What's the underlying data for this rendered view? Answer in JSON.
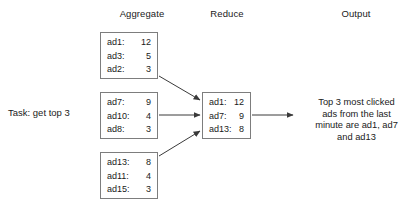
{
  "headers": {
    "aggregate": "Aggregate",
    "reduce": "Reduce",
    "output": "Output"
  },
  "task": {
    "label": "Task: get top 3"
  },
  "aggregate_boxes": [
    {
      "rows": [
        {
          "key": "ad1:",
          "val": "12"
        },
        {
          "key": "ad3:",
          "val": "5"
        },
        {
          "key": "ad2:",
          "val": "3"
        }
      ]
    },
    {
      "rows": [
        {
          "key": "ad7:",
          "val": "9"
        },
        {
          "key": "ad10:",
          "val": "4"
        },
        {
          "key": "ad8:",
          "val": "3"
        }
      ]
    },
    {
      "rows": [
        {
          "key": "ad13:",
          "val": "8"
        },
        {
          "key": "ad11:",
          "val": "4"
        },
        {
          "key": "ad15:",
          "val": "3"
        }
      ]
    }
  ],
  "reduce_box": {
    "rows": [
      {
        "key": "ad1:",
        "val": "12"
      },
      {
        "key": "ad7:",
        "val": "9"
      },
      {
        "key": "ad13:",
        "val": "8"
      }
    ]
  },
  "output": {
    "lines": [
      "Top 3 most clicked",
      "ads from the last",
      "minute are ad1, ad7",
      "and ad13"
    ]
  },
  "colors": {
    "box_border": "#7d7d7d",
    "arrow": "#3a3a3a",
    "text": "#1a1a1a",
    "background": "#ffffff"
  }
}
